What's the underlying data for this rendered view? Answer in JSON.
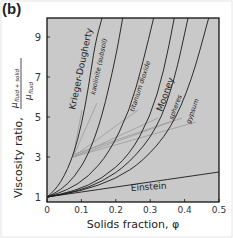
{
  "panel_label": "(b)",
  "chart_data": {
    "type": "line",
    "title": "",
    "xlabel": "Solids fraction, φ",
    "ylabel": "Viscosity ratio, μ_fluid+solid / μ_fluid",
    "ylabel_main": "Viscosity ratio,",
    "ylabel_numerator": "μ",
    "ylabel_numerator_sub": "fluid + solid",
    "ylabel_denominator": "μ",
    "ylabel_denominator_sub": "fluid",
    "xlim": [
      0,
      0.5
    ],
    "ylim": [
      1,
      10.2
    ],
    "x_ticks": [
      "0",
      "0.1",
      "0.2",
      "0.3",
      "0.4",
      "0.5"
    ],
    "y_ticks": [
      "1",
      "3",
      "5",
      "7",
      "9"
    ],
    "grid": false,
    "background": "#c8c8c8",
    "series": [
      {
        "name": "Einstein",
        "label": "Einstein",
        "x": [
          0,
          0.1,
          0.2,
          0.3,
          0.4,
          0.5
        ],
        "y": [
          1,
          1.25,
          1.5,
          1.75,
          2.0,
          2.25
        ]
      },
      {
        "name": "Krieger-Dougherty",
        "label": "Krieger-Dougherty",
        "x": [
          0,
          0.02,
          0.04,
          0.06,
          0.08,
          0.1,
          0.12,
          0.14,
          0.16
        ],
        "y": [
          1,
          1.3,
          1.75,
          2.4,
          3.3,
          4.6,
          6.4,
          8.7,
          10.2
        ]
      },
      {
        "name": "kaolinite (subsoil)",
        "label": "kaolinite (subsoil)",
        "x": [
          0,
          0.04,
          0.08,
          0.12,
          0.16,
          0.2,
          0.22
        ],
        "y": [
          1,
          1.35,
          2.0,
          3.1,
          5.0,
          8.0,
          10.2
        ]
      },
      {
        "name": "titanium dioxide",
        "label": "titanium dioxide",
        "x": [
          0,
          0.06,
          0.12,
          0.18,
          0.24,
          0.28,
          0.31
        ],
        "y": [
          1,
          1.35,
          2.0,
          3.2,
          5.3,
          7.8,
          10.2
        ]
      },
      {
        "name": "Mooney",
        "label": "Mooney",
        "x": [
          0,
          0.08,
          0.16,
          0.24,
          0.3,
          0.34,
          0.37
        ],
        "y": [
          1,
          1.3,
          1.9,
          3.1,
          5.0,
          7.3,
          10.2
        ]
      },
      {
        "name": "spheres",
        "label": "spheres",
        "x": [
          0,
          0.08,
          0.16,
          0.24,
          0.32,
          0.37,
          0.41
        ],
        "y": [
          1,
          1.25,
          1.75,
          2.7,
          4.4,
          6.8,
          10.2
        ]
      },
      {
        "name": "gypsum",
        "label": "gypsum",
        "x": [
          0,
          0.1,
          0.2,
          0.28,
          0.36,
          0.42,
          0.47
        ],
        "y": [
          1,
          1.3,
          1.9,
          2.8,
          4.4,
          6.8,
          10.2
        ]
      }
    ],
    "annotations": [
      {
        "text": "Krieger-Dougherty",
        "rotation": -78
      },
      {
        "text": "kaolinite (subsoil)",
        "rotation": -78
      },
      {
        "text": "titanium dioxide",
        "rotation": -72
      },
      {
        "text": "Mooney",
        "rotation": -70
      },
      {
        "text": "spheres",
        "rotation": -70
      },
      {
        "text": "gypsum",
        "rotation": -70
      },
      {
        "text": "Einstein",
        "rotation": -4
      }
    ]
  }
}
